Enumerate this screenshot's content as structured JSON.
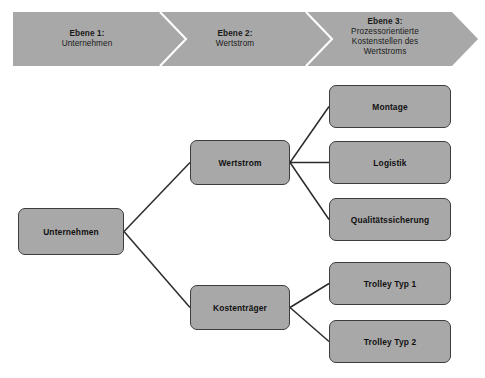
{
  "figure": {
    "caption": ""
  },
  "banner": {
    "fill_color": "#a8a8a8",
    "separator_color": "#ffffff",
    "stages": [
      {
        "level": "Ebene 1:",
        "name": "Unternehmen"
      },
      {
        "level": "Ebene 2:",
        "name": "Wertstrom"
      },
      {
        "level": "Ebene 3:",
        "name": "Prozessorientierte\nKostenstellen des\nWertstroms"
      }
    ]
  },
  "diagram": {
    "node_fill": "#a8a8a8",
    "node_border": "#3d3d3d",
    "connector_color": "#2b2b2b",
    "nodes": {
      "unternehmen": "Unternehmen",
      "wertstrom": "Wertstrom",
      "kostentraeger": "Kostenträger",
      "montage": "Montage",
      "logistik": "Logistik",
      "qualitaetssicherung": "Qualitätssicherung",
      "trolley_typ_1": "Trolley Typ 1",
      "trolley_typ_2": "Trolley Typ 2"
    }
  }
}
